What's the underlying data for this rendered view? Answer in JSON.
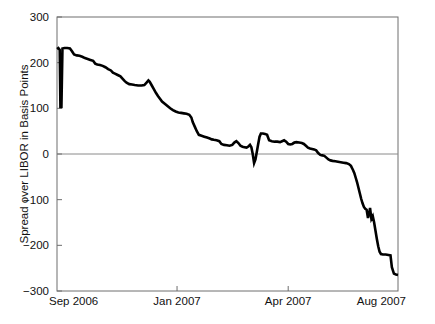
{
  "chart_data": {
    "type": "line",
    "title": "",
    "subtitle": "",
    "xlabel": "",
    "ylabel": "Spread over LIBOR in Basis Points",
    "xlim": [
      "Sep 2006",
      "Aug 2007"
    ],
    "ylim": [
      -300,
      300
    ],
    "grid": false,
    "legend": null,
    "legend_position": "none",
    "zero_reference_line": 0,
    "y_ticks": [
      300,
      200,
      100,
      0,
      -100,
      -200,
      -300
    ],
    "y_tick_labels": [
      "300",
      "200",
      "100",
      "0",
      "-100",
      "-200",
      "-300"
    ],
    "x_ticks": [
      "Sep 2006",
      "Jan 2007",
      "Apr 2007",
      "Aug 2007"
    ],
    "x_tick_labels": [
      "Sep 2006",
      "Jan 2007",
      "Apr 2007",
      "Aug 2007"
    ],
    "x_tick_fractions": [
      0.0,
      0.352,
      0.678,
      1.0
    ],
    "series": [
      {
        "name": "Spread over LIBOR",
        "color": "#000000",
        "line_width": 2.6,
        "points": [
          [
            0.0,
            230
          ],
          [
            0.004,
            232
          ],
          [
            0.008,
            228
          ],
          [
            0.01,
            103
          ],
          [
            0.013,
            103
          ],
          [
            0.016,
            231
          ],
          [
            0.022,
            232
          ],
          [
            0.03,
            232
          ],
          [
            0.038,
            231
          ],
          [
            0.044,
            225
          ],
          [
            0.05,
            218
          ],
          [
            0.058,
            216
          ],
          [
            0.066,
            215
          ],
          [
            0.074,
            213
          ],
          [
            0.082,
            210
          ],
          [
            0.09,
            208
          ],
          [
            0.098,
            206
          ],
          [
            0.106,
            204
          ],
          [
            0.112,
            198
          ],
          [
            0.118,
            196
          ],
          [
            0.126,
            195
          ],
          [
            0.134,
            193
          ],
          [
            0.142,
            190
          ],
          [
            0.15,
            186
          ],
          [
            0.158,
            183
          ],
          [
            0.164,
            178
          ],
          [
            0.17,
            176
          ],
          [
            0.178,
            173
          ],
          [
            0.186,
            170
          ],
          [
            0.192,
            165
          ],
          [
            0.198,
            160
          ],
          [
            0.204,
            156
          ],
          [
            0.212,
            153
          ],
          [
            0.22,
            152
          ],
          [
            0.228,
            151
          ],
          [
            0.238,
            150
          ],
          [
            0.248,
            150
          ],
          [
            0.256,
            151
          ],
          [
            0.262,
            156
          ],
          [
            0.268,
            161
          ],
          [
            0.272,
            158
          ],
          [
            0.278,
            150
          ],
          [
            0.284,
            142
          ],
          [
            0.29,
            134
          ],
          [
            0.296,
            127
          ],
          [
            0.302,
            121
          ],
          [
            0.308,
            115
          ],
          [
            0.316,
            110
          ],
          [
            0.324,
            105
          ],
          [
            0.332,
            100
          ],
          [
            0.34,
            96
          ],
          [
            0.348,
            93
          ],
          [
            0.356,
            91
          ],
          [
            0.364,
            90
          ],
          [
            0.372,
            89
          ],
          [
            0.38,
            88
          ],
          [
            0.388,
            86
          ],
          [
            0.394,
            80
          ],
          [
            0.398,
            70
          ],
          [
            0.404,
            60
          ],
          [
            0.41,
            50
          ],
          [
            0.416,
            42
          ],
          [
            0.424,
            40
          ],
          [
            0.432,
            38
          ],
          [
            0.44,
            36
          ],
          [
            0.448,
            34
          ],
          [
            0.454,
            32
          ],
          [
            0.46,
            31
          ],
          [
            0.468,
            30
          ],
          [
            0.476,
            28
          ],
          [
            0.482,
            22
          ],
          [
            0.49,
            20
          ],
          [
            0.498,
            19
          ],
          [
            0.506,
            18
          ],
          [
            0.514,
            20
          ],
          [
            0.52,
            25
          ],
          [
            0.526,
            28
          ],
          [
            0.532,
            24
          ],
          [
            0.538,
            18
          ],
          [
            0.544,
            16
          ],
          [
            0.55,
            15
          ],
          [
            0.556,
            14
          ],
          [
            0.562,
            17
          ],
          [
            0.566,
            20
          ],
          [
            0.57,
            15
          ],
          [
            0.574,
            0
          ],
          [
            0.578,
            -20
          ],
          [
            0.582,
            -12
          ],
          [
            0.586,
            5
          ],
          [
            0.59,
            22
          ],
          [
            0.594,
            38
          ],
          [
            0.598,
            45
          ],
          [
            0.604,
            45
          ],
          [
            0.61,
            44
          ],
          [
            0.616,
            42
          ],
          [
            0.622,
            30
          ],
          [
            0.63,
            28
          ],
          [
            0.638,
            27
          ],
          [
            0.646,
            27
          ],
          [
            0.654,
            26
          ],
          [
            0.66,
            28
          ],
          [
            0.666,
            30
          ],
          [
            0.672,
            27
          ],
          [
            0.678,
            22
          ],
          [
            0.684,
            21
          ],
          [
            0.69,
            22
          ],
          [
            0.696,
            25
          ],
          [
            0.702,
            26
          ],
          [
            0.71,
            25
          ],
          [
            0.718,
            24
          ],
          [
            0.724,
            22
          ],
          [
            0.73,
            18
          ],
          [
            0.736,
            14
          ],
          [
            0.742,
            12
          ],
          [
            0.748,
            11
          ],
          [
            0.754,
            10
          ],
          [
            0.76,
            8
          ],
          [
            0.766,
            2
          ],
          [
            0.772,
            -2
          ],
          [
            0.778,
            -3
          ],
          [
            0.784,
            -4
          ],
          [
            0.79,
            -8
          ],
          [
            0.796,
            -12
          ],
          [
            0.802,
            -14
          ],
          [
            0.808,
            -15
          ],
          [
            0.816,
            -16
          ],
          [
            0.824,
            -17
          ],
          [
            0.832,
            -18
          ],
          [
            0.84,
            -19
          ],
          [
            0.848,
            -20
          ],
          [
            0.856,
            -22
          ],
          [
            0.862,
            -26
          ],
          [
            0.868,
            -35
          ],
          [
            0.872,
            -42
          ],
          [
            0.876,
            -52
          ],
          [
            0.88,
            -62
          ],
          [
            0.884,
            -74
          ],
          [
            0.888,
            -86
          ],
          [
            0.892,
            -98
          ],
          [
            0.896,
            -108
          ],
          [
            0.9,
            -116
          ],
          [
            0.904,
            -120
          ],
          [
            0.908,
            -122
          ],
          [
            0.912,
            -140
          ],
          [
            0.916,
            -128
          ],
          [
            0.918,
            -118
          ],
          [
            0.92,
            -130
          ],
          [
            0.922,
            -142
          ],
          [
            0.926,
            -136
          ],
          [
            0.93,
            -150
          ],
          [
            0.934,
            -168
          ],
          [
            0.938,
            -186
          ],
          [
            0.942,
            -202
          ],
          [
            0.946,
            -214
          ],
          [
            0.95,
            -219
          ],
          [
            0.956,
            -220
          ],
          [
            0.964,
            -220
          ],
          [
            0.972,
            -221
          ],
          [
            0.978,
            -222
          ],
          [
            0.982,
            -248
          ],
          [
            0.988,
            -262
          ],
          [
            0.994,
            -264
          ],
          [
            1.0,
            -265
          ]
        ]
      }
    ]
  },
  "geometry": {
    "plot_left": 57,
    "plot_right": 398,
    "plot_top": 17,
    "plot_bottom": 291
  }
}
